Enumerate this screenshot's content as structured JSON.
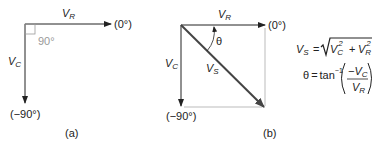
{
  "diagram_a": {
    "vr_label": "V",
    "vr_sub": "R",
    "vc_label": "V",
    "vc_sub": "C",
    "angle_label": "90°",
    "zero_label": "(0°)",
    "neg90_label": "(−90°)",
    "caption": "(a)"
  },
  "diagram_b": {
    "vr_label": "V",
    "vr_sub": "R",
    "vc_label": "V",
    "vc_sub": "C",
    "vs_label": "V",
    "vs_sub": "S",
    "theta_label": "θ",
    "zero_label": "(0°)",
    "neg90_label": "(−90°)",
    "caption": "(b)"
  },
  "formulas": {
    "vs_lhs": "V",
    "vs_lhs_sub": "S",
    "eq": "=",
    "vc": "V",
    "vc_sub": "C",
    "sq": "2",
    "plus": "+",
    "vr": "V",
    "vr_sub": "R",
    "theta": "θ",
    "tan": "tan",
    "inv": "−1",
    "num_minus": "−V",
    "num_sub": "C",
    "den": "V",
    "den_sub": "R"
  }
}
